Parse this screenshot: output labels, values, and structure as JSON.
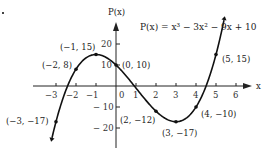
{
  "chart_data": {
    "type": "line",
    "title": "P(x) = x³ − 3x² − 9x + 10",
    "xlabel": "x",
    "ylabel": "P(x)",
    "xlim": [
      -3.4,
      6.5
    ],
    "ylim": [
      -26,
      30
    ],
    "x_ticks": [
      "-3",
      "-2",
      "-1",
      "0",
      "1",
      "2",
      "3",
      "4",
      "5",
      "6"
    ],
    "y_ticks": [
      "20",
      "10",
      "-10",
      "-20"
    ],
    "grid": false,
    "series": [
      {
        "name": "P(x) = x³ − 3x² − 9x + 10",
        "function": "x^3 - 3x^2 - 9x + 10",
        "x": [
          -3,
          -2,
          -1,
          0,
          2,
          3,
          4,
          5
        ],
        "y": [
          -17,
          8,
          15,
          10,
          -12,
          -17,
          -10,
          15
        ]
      }
    ],
    "annotations": [
      {
        "text": "(−3, −17)",
        "x": -3,
        "y": -17
      },
      {
        "text": "(−2, 8)",
        "x": -2,
        "y": 8
      },
      {
        "text": "(−1, 15)",
        "x": -1,
        "y": 15
      },
      {
        "text": "(0, 10)",
        "x": 0,
        "y": 10
      },
      {
        "text": "(2, −12)",
        "x": 2,
        "y": -12
      },
      {
        "text": "(3, −17)",
        "x": 3,
        "y": -17
      },
      {
        "text": "(4, −10)",
        "x": 4,
        "y": -10
      },
      {
        "text": "(5, 15)",
        "x": 5,
        "y": 15
      }
    ]
  },
  "labels": {
    "equation": "P(x) = x³ − 3x² − 9x + 10",
    "y_axis": "P(x)",
    "x_axis": "x",
    "x_ticks": [
      "−3",
      "−2",
      "−1",
      "0",
      "1",
      "2",
      "3",
      "4",
      "5",
      "6"
    ],
    "y_ticks": [
      "20",
      "10",
      "− 10",
      "− 20"
    ],
    "points": [
      "(−3, −17)",
      "(−2, 8)",
      "(−1, 15)",
      "(0, 10)",
      "(2, −12)",
      "(3, −17)",
      "(4, −10)",
      "(5, 15)"
    ]
  }
}
